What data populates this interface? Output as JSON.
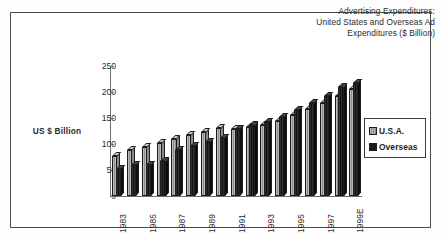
{
  "chart_data": {
    "type": "bar",
    "title": "Advertising Expenditures: United States and Overseas Ad Expenditures ($ Billion)",
    "title_lines": [
      "Advertising Expenditures:",
      "United States and Overseas Ad",
      "Expenditures ($ Billion)"
    ],
    "xlabel": "",
    "ylabel": "US $ Billion",
    "ylim": [
      0,
      250
    ],
    "yticks": [
      0,
      50,
      100,
      150,
      200,
      250
    ],
    "grid": false,
    "legend_position": "right",
    "categories": [
      "1983",
      "1984",
      "1985",
      "1986",
      "1987",
      "1988",
      "1989",
      "1990",
      "1991",
      "1992",
      "1993",
      "1994",
      "1995",
      "1996",
      "1997",
      "1998",
      "1999E"
    ],
    "tick_labels_visible": [
      "1983",
      "1985",
      "1987",
      "1989",
      "1991",
      "1993",
      "1995",
      "1997",
      "1999E"
    ],
    "series": [
      {
        "name": "U.S.A.",
        "color": "#b9b9b9",
        "values": [
          76,
          88,
          95,
          102,
          110,
          118,
          124,
          130,
          129,
          133,
          136,
          145,
          155,
          168,
          178,
          192,
          205
        ]
      },
      {
        "name": "Overseas",
        "color": "#1a1a1a",
        "values": [
          52,
          60,
          60,
          68,
          88,
          96,
          104,
          112,
          128,
          136,
          142,
          152,
          166,
          178,
          192,
          210,
          218
        ]
      }
    ]
  },
  "legend": {
    "entries": [
      {
        "label": "U.S.A.",
        "swatch": "usa"
      },
      {
        "label": "Overseas",
        "swatch": "overseas"
      }
    ]
  }
}
